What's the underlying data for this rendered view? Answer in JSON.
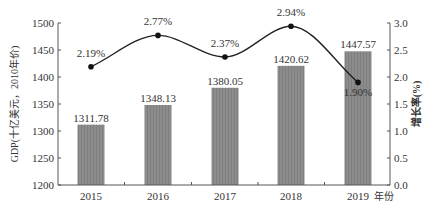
{
  "chart_data": {
    "type": "bar+line",
    "title": "",
    "categories": [
      "2015",
      "2016",
      "2017",
      "2018",
      "2019"
    ],
    "xlabel": "年份",
    "series": [
      {
        "name": "GDP",
        "type": "bar",
        "axis": "left",
        "values": [
          1311.78,
          1348.13,
          1380.05,
          1420.62,
          1447.57
        ],
        "labels": [
          "1311.78",
          "1348.13",
          "1380.05",
          "1420.62",
          "1447.57"
        ],
        "color": "#8a8a8a"
      },
      {
        "name": "增长率",
        "type": "line",
        "axis": "right",
        "values": [
          2.19,
          2.77,
          2.37,
          2.94,
          1.9
        ],
        "labels": [
          "2.19%",
          "2.77%",
          "2.37%",
          "2.94%",
          "1.90%"
        ],
        "color": "#222222",
        "smooth": true
      }
    ],
    "ylabel_left": "GDP(十亿美元，2010年价)",
    "ylabel_right": "增长率(%)",
    "ylim_left": [
      1200,
      1500
    ],
    "yticks_left": [
      "1200",
      "1250",
      "1300",
      "1350",
      "1400",
      "1450",
      "1500"
    ],
    "ylim_right": [
      0,
      3.0
    ],
    "yticks_right": [
      "0.0",
      "0.5",
      "1.0",
      "1.5",
      "2.0",
      "2.5",
      "3.0"
    ],
    "grid": false,
    "legend": "none"
  }
}
